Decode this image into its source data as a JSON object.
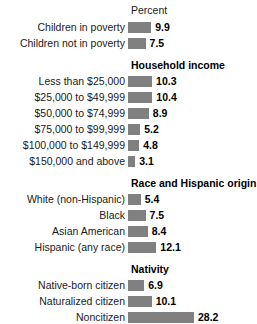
{
  "chart": {
    "axis_title": "Percent",
    "value_suffix": ""
  },
  "chart_data": {
    "type": "bar",
    "orientation": "horizontal",
    "title": "",
    "xlabel": "Percent",
    "ylabel": "",
    "xlim": [
      0,
      28.2
    ],
    "grid": false,
    "legend": "none",
    "bar_color": "#808080",
    "groups": [
      {
        "heading": "",
        "categories": [
          "Children in poverty",
          "Children not in poverty"
        ],
        "values": [
          9.9,
          7.5
        ]
      },
      {
        "heading": "Household income",
        "categories": [
          "Less than $25,000",
          "$25,000 to $49,999",
          "$50,000 to $74,999",
          "$75,000 to $99,999",
          "$100,000 to $149,999",
          "$150,000 and above"
        ],
        "values": [
          10.3,
          10.4,
          8.9,
          5.2,
          4.8,
          3.1
        ]
      },
      {
        "heading": "Race and Hispanic origin",
        "categories": [
          "White (non-Hispanic)",
          "Black",
          "Asian American",
          "Hispanic (any race)"
        ],
        "values": [
          5.4,
          7.5,
          8.4,
          12.1
        ]
      },
      {
        "heading": "Nativity",
        "categories": [
          "Native-born citizen",
          "Naturalized citizen",
          "Noncitizen"
        ],
        "values": [
          6.9,
          10.1,
          28.2
        ]
      }
    ],
    "categories": [
      "Children in poverty",
      "Children not in poverty",
      "Less than $25,000",
      "$25,000 to $49,999",
      "$50,000 to $74,999",
      "$75,000 to $99,999",
      "$100,000 to $149,999",
      "$150,000 and above",
      "White (non-Hispanic)",
      "Black",
      "Asian American",
      "Hispanic (any race)",
      "Native-born citizen",
      "Naturalized citizen",
      "Noncitizen"
    ],
    "values": [
      9.9,
      7.5,
      10.3,
      10.4,
      8.9,
      5.2,
      4.8,
      3.1,
      5.4,
      7.5,
      8.4,
      12.1,
      6.9,
      10.1,
      28.2
    ]
  }
}
